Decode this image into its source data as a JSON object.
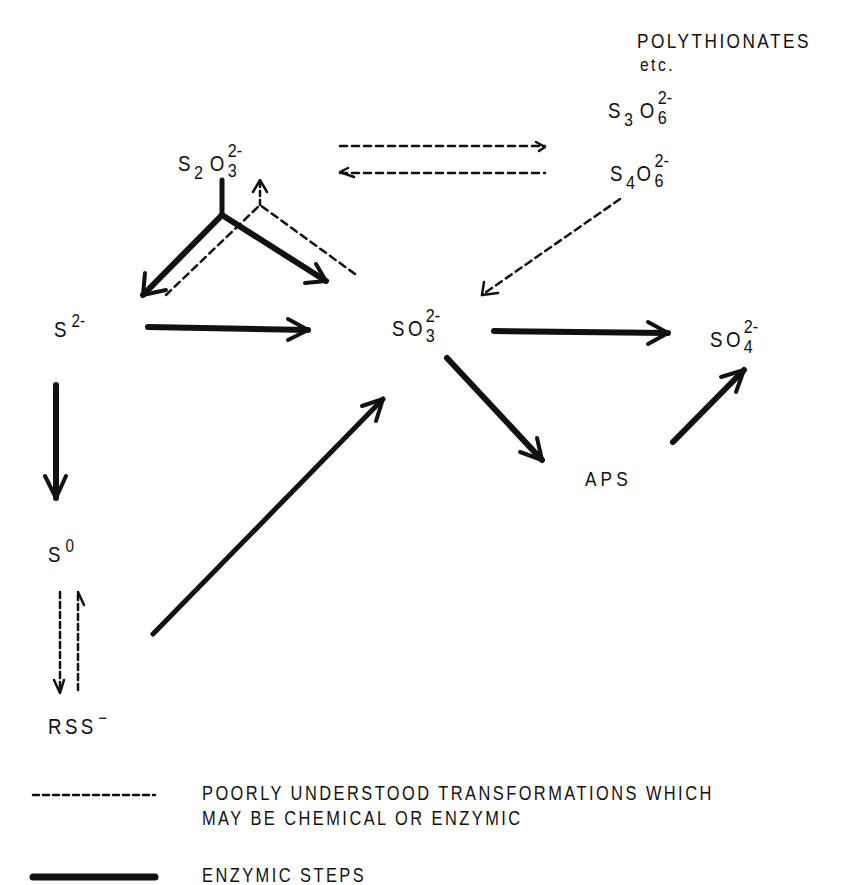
{
  "diagram": {
    "type": "reaction-pathway",
    "nodes": {
      "polythionates_title": "POLYTHIONATES",
      "polythionates_etc": "etc.",
      "trithionate": {
        "el1": "S",
        "sub1": "3",
        "el2": "O",
        "sub2": "6",
        "charge": "2-"
      },
      "tetrathionate": {
        "el1": "S",
        "sub1": "4",
        "el2": "O",
        "sub2": "6",
        "charge": "2-"
      },
      "thiosulfate": {
        "el1": "S",
        "sub1": "2",
        "el2": "O",
        "sub2": "3",
        "charge": "2-"
      },
      "sulfide": {
        "el1": "S",
        "charge": "2-"
      },
      "sulfite": {
        "el1": "S",
        "el2": "O",
        "sub2": "3",
        "charge": "2-"
      },
      "sulfate": {
        "el1": "S",
        "el2": "O",
        "sub2": "4",
        "charge": "2-"
      },
      "aps": "APS",
      "elemental_sulfur": {
        "el1": "S",
        "charge": "0"
      },
      "persulfide": {
        "el1": "RSS",
        "charge": "−"
      }
    },
    "edges": [
      {
        "from": "thiosulfate",
        "to": "sulfide",
        "style": "solid"
      },
      {
        "from": "thiosulfate",
        "to": "sulfite",
        "style": "solid"
      },
      {
        "from": "sulfide",
        "to": "thiosulfate",
        "style": "dashed"
      },
      {
        "from": "sulfite",
        "to": "thiosulfate",
        "style": "dashed"
      },
      {
        "from": "thiosulfate",
        "to": "polythionates",
        "style": "dashed"
      },
      {
        "from": "polythionates",
        "to": "thiosulfate",
        "style": "dashed"
      },
      {
        "from": "polythionates",
        "to": "sulfite",
        "style": "dashed"
      },
      {
        "from": "sulfide",
        "to": "sulfite",
        "style": "solid"
      },
      {
        "from": "sulfite",
        "to": "sulfate",
        "style": "solid"
      },
      {
        "from": "sulfite",
        "to": "aps",
        "style": "solid"
      },
      {
        "from": "aps",
        "to": "sulfate",
        "style": "solid"
      },
      {
        "from": "sulfide",
        "to": "elemental_sulfur",
        "style": "solid"
      },
      {
        "from": "elemental_sulfur",
        "to": "persulfide",
        "style": "dashed"
      },
      {
        "from": "persulfide",
        "to": "elemental_sulfur",
        "style": "dashed"
      },
      {
        "from": "persulfide",
        "to": "sulfite",
        "style": "solid"
      }
    ]
  },
  "legend": {
    "dashed": {
      "line1": "POORLY UNDERSTOOD TRANSFORMATIONS WHICH",
      "line2": "MAY BE CHEMICAL OR ENZYMIC"
    },
    "solid": {
      "line1": "ENZYMIC STEPS"
    }
  },
  "colors": {
    "ink": "#111111",
    "background": "#ffffff"
  }
}
